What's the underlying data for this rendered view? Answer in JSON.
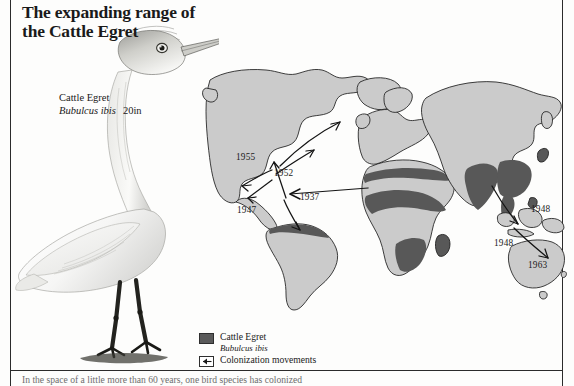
{
  "title": {
    "line1": "The expanding range of",
    "line2": "the Cattle Egret"
  },
  "caption": {
    "common_name": "Cattle Egret",
    "scientific_name": "Bubulcus ibis",
    "size": "20in"
  },
  "map": {
    "date_labels": [
      {
        "text": "1955",
        "x": 236,
        "y": 152
      },
      {
        "text": "1952",
        "x": 274,
        "y": 168
      },
      {
        "text": "1937",
        "x": 300,
        "y": 192
      },
      {
        "text": "1947",
        "x": 237,
        "y": 205
      },
      {
        "text": "1948",
        "x": 531,
        "y": 204
      },
      {
        "text": "1948",
        "x": 494,
        "y": 238
      },
      {
        "text": "1963",
        "x": 528,
        "y": 260
      }
    ]
  },
  "legend": {
    "items": [
      {
        "icon": "gray-swatch-icon",
        "label": "Cattle Egret",
        "scientific_name": "Bubulcus ibis"
      },
      {
        "icon": "arrow-box-icon",
        "label": "Colonization movements"
      }
    ]
  },
  "body": {
    "text": "In the space of a little more than 60 years, one bird species has colonized"
  },
  "colors": {
    "land": "#cbcbcb",
    "range": "#585858",
    "outline": "#1f1f1f",
    "rule": "#2b2b2b",
    "text": "#1a1a1a"
  }
}
